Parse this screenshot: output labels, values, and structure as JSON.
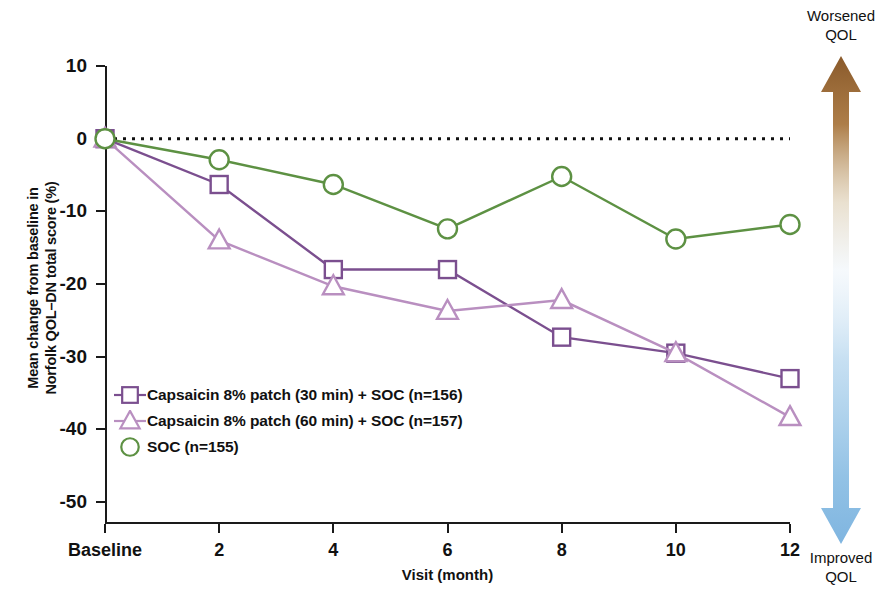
{
  "chart_data": {
    "type": "line",
    "title": "",
    "xlabel": "Visit (month)",
    "ylabel": "Mean change from baseline in Norfolk QOL–DN total score (%)",
    "ylabel_line1": "Mean change from baseline in",
    "ylabel_line2": "Norfolk QOL–DN total score (%)",
    "categories": [
      "Baseline",
      "2",
      "4",
      "6",
      "8",
      "10",
      "12"
    ],
    "x": [
      0,
      2,
      4,
      6,
      8,
      10,
      12
    ],
    "xticklabels": [
      "Baseline",
      "2",
      "4",
      "6",
      "8",
      "10",
      "12"
    ],
    "yticklabels": [
      "10",
      "0",
      "-10",
      "-20",
      "-30",
      "-40",
      "-50"
    ],
    "yticks": [
      10,
      0,
      -10,
      -20,
      -30,
      -40,
      -50
    ],
    "ylim": [
      -53,
      10
    ],
    "xlim": [
      0,
      12
    ],
    "grid": false,
    "legend_position": "inside lower left",
    "reference_line": {
      "value": 0,
      "style": "dotted",
      "color": "#111111"
    },
    "series": [
      {
        "name": "Capsaicin 8% patch (30 min) + SOC (n=156)",
        "marker": "square",
        "color": "#7b4f8f",
        "values": [
          0,
          -6.3,
          -18.0,
          -18.0,
          -27.3,
          -29.5,
          -33.0
        ]
      },
      {
        "name": "Capsaicin 8% patch (60 min) + SOC (n=157)",
        "marker": "triangle",
        "color": "#b98fc0",
        "values": [
          0,
          -14.0,
          -20.3,
          -23.7,
          -22.2,
          -29.5,
          -38.3
        ]
      },
      {
        "name": "SOC (n=155)",
        "marker": "circle",
        "color": "#5d9143",
        "values": [
          0,
          -2.9,
          -6.3,
          -12.4,
          -5.2,
          -13.8,
          -11.8
        ]
      }
    ]
  },
  "legend": {
    "items": [
      {
        "label": "Capsaicin 8% patch (30 min) + SOC (n=156)",
        "marker": "square-marker-icon",
        "color": "#7b4f8f"
      },
      {
        "label": "Capsaicin 8% patch (60 min) + SOC (n=157)",
        "marker": "triangle-marker-icon",
        "color": "#b98fc0"
      },
      {
        "label": "SOC (n=155)",
        "marker": "circle-marker-icon",
        "color": "#5d9143"
      }
    ]
  },
  "annotation": {
    "top_line1": "Worsened",
    "top_line2": "QOL",
    "bottom_line1": "Improved",
    "bottom_line2": "QOL",
    "arrow_top_color": "#8a5a2b",
    "arrow_bottom_color": "#7fb5e0"
  }
}
